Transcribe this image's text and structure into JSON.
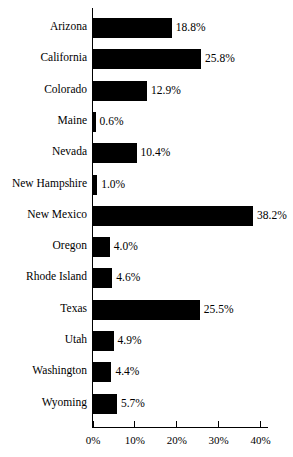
{
  "chart_data": {
    "type": "bar",
    "orientation": "horizontal",
    "title": "",
    "subtitle": "",
    "xlabel": "",
    "ylabel": "",
    "xlim": [
      0,
      42
    ],
    "xticks": [
      0,
      10,
      20,
      30,
      40
    ],
    "xtick_labels": [
      "0%",
      "10%",
      "20%",
      "30%",
      "40%"
    ],
    "grid": false,
    "legend": null,
    "bar_color": "#000000",
    "background_color": "#FFFFFF",
    "axis_color": "#000000",
    "categories": [
      "Arizona",
      "California",
      "Colorado",
      "Maine",
      "Nevada",
      "New Hampshire",
      "New Mexico",
      "Oregon",
      "Rhode Island",
      "Texas",
      "Utah",
      "Washington",
      "Wyoming"
    ],
    "values": [
      18.8,
      25.8,
      12.9,
      0.6,
      10.4,
      1.0,
      38.2,
      4.0,
      4.6,
      25.5,
      4.9,
      4.4,
      5.7
    ],
    "value_labels": [
      "18.8%",
      "25.8%",
      "12.9%",
      "0.6%",
      "10.4%",
      "1.0%",
      "38.2%",
      "4.0%",
      "4.6%",
      "25.5%",
      "4.9%",
      "4.4%",
      "5.7%"
    ]
  }
}
